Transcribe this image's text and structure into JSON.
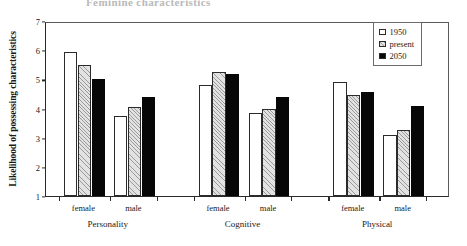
{
  "running_head": "Feminine characteristics",
  "chart_data": {
    "type": "bar",
    "title": "",
    "xlabel": "",
    "ylabel": "Likelihood of possessing characteristics",
    "ylim": [
      1,
      7
    ],
    "yticks": [
      1,
      2,
      3,
      4,
      5,
      6,
      7
    ],
    "grid": false,
    "legend_position": "top-right",
    "groups": [
      "Personality",
      "Cognitive",
      "Physical"
    ],
    "subcategories": [
      "female",
      "male"
    ],
    "categories": [
      "Personality female",
      "Personality male",
      "Cognitive female",
      "Cognitive male",
      "Physical female",
      "Physical male"
    ],
    "series": [
      {
        "name": "1950",
        "style": "open",
        "values": [
          5.95,
          3.75,
          4.8,
          3.85,
          4.9,
          3.1
        ]
      },
      {
        "name": "present",
        "style": "hatched",
        "values": [
          5.5,
          4.05,
          5.25,
          4.0,
          4.45,
          3.25
        ]
      },
      {
        "name": "2050",
        "style": "solid",
        "values": [
          5.0,
          4.4,
          5.2,
          4.4,
          4.55,
          4.1
        ]
      }
    ]
  },
  "legend": {
    "items": [
      {
        "label": "1950"
      },
      {
        "label": "present"
      },
      {
        "label": "2050"
      }
    ]
  },
  "colors": {
    "axis": "#2a2a2a",
    "series_1950": "#ffffff",
    "series_present": "#e2e2e2",
    "series_2050": "#070707"
  }
}
